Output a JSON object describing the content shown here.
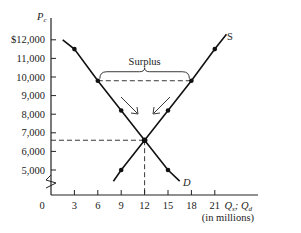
{
  "chart_data": {
    "type": "line",
    "title": "",
    "xlabel": "Qs, Qd",
    "xlabel_note": "(in millions)",
    "ylabel": "Pc",
    "x_ticks": [
      0,
      3,
      6,
      9,
      12,
      15,
      18,
      21
    ],
    "x_tick_labels": [
      "0",
      "3",
      "6",
      "9",
      "12",
      "15",
      "18",
      "21"
    ],
    "y_ticks": [
      5000,
      6000,
      7000,
      8000,
      9000,
      10000,
      11000,
      12000
    ],
    "y_tick_labels": [
      "5,000",
      "6,000",
      "7,000",
      "8,000",
      "9,000",
      "10,000",
      "11,000",
      "$12,000"
    ],
    "xlim": [
      0,
      24
    ],
    "ylim": [
      4000,
      12500
    ],
    "axis_break": true,
    "grid": false,
    "series": [
      {
        "name": "S",
        "label": "S",
        "points": [
          [
            8,
            4400
          ],
          [
            9,
            5000
          ],
          [
            12,
            6600
          ],
          [
            15,
            8200
          ],
          [
            18,
            9800
          ],
          [
            21,
            11500
          ],
          [
            22.5,
            12300
          ]
        ],
        "markers": [
          [
            9,
            5000
          ],
          [
            15,
            8200
          ],
          [
            18,
            9800
          ],
          [
            21,
            11500
          ]
        ]
      },
      {
        "name": "D",
        "label": "D",
        "points": [
          [
            1.5,
            12000
          ],
          [
            3,
            11500
          ],
          [
            6,
            9800
          ],
          [
            9,
            8200
          ],
          [
            12,
            6600
          ],
          [
            15,
            5000
          ],
          [
            16.5,
            4400
          ]
        ],
        "markers": [
          [
            3,
            11500
          ],
          [
            6,
            9800
          ],
          [
            9,
            8200
          ],
          [
            15,
            5000
          ]
        ]
      }
    ],
    "equilibrium": {
      "q": 12,
      "p": 6600
    },
    "annotations": [
      {
        "text": "Surplus",
        "type": "brace",
        "from_q": 6,
        "to_q": 18,
        "at_p": 9800
      },
      {
        "type": "dashed-line",
        "from": [
          6,
          9800
        ],
        "to": [
          18,
          9800
        ]
      },
      {
        "type": "dashed-line",
        "from": [
          0,
          6600
        ],
        "to": [
          12,
          6600
        ]
      },
      {
        "type": "dashed-line",
        "from": [
          12,
          6600
        ],
        "to": [
          12,
          4000
        ]
      },
      {
        "type": "arrow",
        "direction": "toward-equilibrium",
        "side": "demand"
      },
      {
        "type": "arrow",
        "direction": "toward-equilibrium",
        "side": "supply"
      }
    ]
  },
  "labels": {
    "y_axis": "P",
    "y_axis_sub": "c",
    "x_axis": "Q",
    "x_axis_sub1": "s",
    "x_axis_sep": "; Q",
    "x_axis_sub2": "d",
    "x_axis_note": "(in millions)",
    "surplus": "Surplus",
    "supply": "S",
    "demand": "D"
  }
}
